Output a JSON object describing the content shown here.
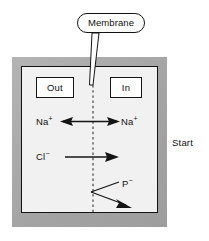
{
  "figure": {
    "caption_right": "Start",
    "callout": {
      "label": "Membrane"
    },
    "compartments": {
      "left_label": "Out",
      "right_label": "In"
    },
    "species": [
      {
        "key": "na_out",
        "symbol": "Na",
        "charge": "+",
        "side": "out"
      },
      {
        "key": "na_in",
        "symbol": "Na",
        "charge": "+",
        "side": "in"
      },
      {
        "key": "cl_out",
        "symbol": "Cl",
        "charge": "−",
        "side": "out"
      },
      {
        "key": "p_in",
        "symbol": "P",
        "charge": "−",
        "side": "in"
      }
    ],
    "labels": {
      "na_out": "Na",
      "na_out_charge": "+",
      "na_in": "Na",
      "na_in_charge": "+",
      "cl": "Cl",
      "cl_charge": "−",
      "p": "P",
      "p_charge": "−"
    },
    "colors": {
      "outer_frame": "#a9a9a9",
      "inner_panel": "#f1f1f1",
      "stroke": "#121212",
      "box_fill": "#ffffff",
      "background": "#ffffff"
    }
  }
}
